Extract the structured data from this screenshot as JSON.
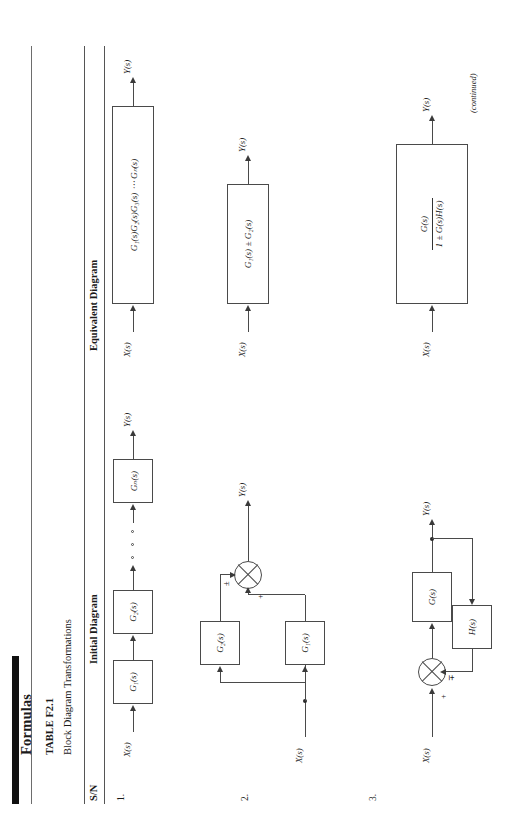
{
  "page": {
    "title": "Formulas",
    "table_number": "TABLE F2.1",
    "caption": "Block Diagram Transformations",
    "continued_note": "(continued)"
  },
  "table": {
    "columns": [
      "S/N",
      "Initial Diagram",
      "Equivalent Diagram"
    ],
    "rows": [
      {
        "sn": "1.",
        "type": "cascade",
        "initial": {
          "input_label": "X(s)",
          "output_label": "Y(s)",
          "blocks": [
            "G₁(s)",
            "G₂(s)",
            "Gₙ(s)"
          ],
          "ellipsis": "○ ○ ○"
        },
        "equivalent": {
          "input_label": "X(s)",
          "output_label": "Y(s)",
          "expression": "G₁(s)G₂(s)G₃(s) ⋯ Gₙ(s)"
        }
      },
      {
        "sn": "2.",
        "type": "parallel",
        "initial": {
          "input_label": "X(s)",
          "output_label": "Y(s)",
          "blocks": [
            "G₁(s)",
            "G₂(s)"
          ],
          "sum_signs": [
            "+",
            "±"
          ]
        },
        "equivalent": {
          "input_label": "X(s)",
          "output_label": "Y(s)",
          "expression": "G₁(s) ± G₂(s)"
        }
      },
      {
        "sn": "3.",
        "type": "feedback",
        "initial": {
          "input_label": "X(s)",
          "output_label": "Y(s)",
          "forward_block": "G(s)",
          "feedback_block": "H(s)",
          "sum_signs": [
            "+",
            "∓"
          ]
        },
        "equivalent": {
          "input_label": "X(s)",
          "output_label": "Y(s)",
          "numerator": "G(s)",
          "denominator": "1 ± G(s)H(s)"
        }
      }
    ]
  },
  "colors": {
    "ink": "#1a1a1a",
    "rule": "#555555",
    "line": "#4a4a4a",
    "bar": "#111111",
    "paper": "#ffffff"
  }
}
